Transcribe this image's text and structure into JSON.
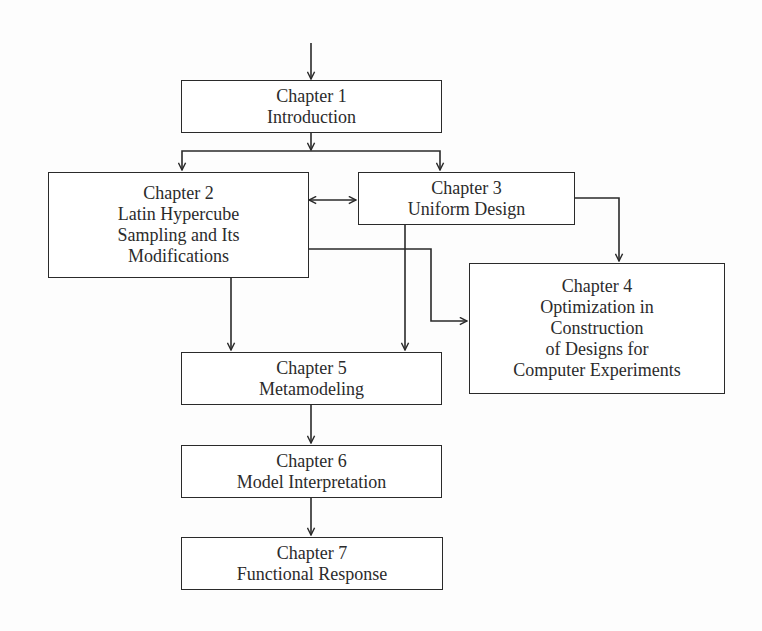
{
  "diagram": {
    "type": "flowchart",
    "colors": {
      "line": "#2a2a2a",
      "text": "#2b2b2b",
      "background": "#fdfdfd"
    },
    "nodes": [
      {
        "id": "ch1",
        "title": "Chapter 1",
        "lines": [
          "Introduction"
        ]
      },
      {
        "id": "ch2",
        "title": "Chapter 2",
        "lines": [
          "Latin Hypercube",
          "Sampling and Its",
          "Modifications"
        ]
      },
      {
        "id": "ch3",
        "title": "Chapter 3",
        "lines": [
          "Uniform Design"
        ]
      },
      {
        "id": "ch4",
        "title": "Chapter 4",
        "lines": [
          "Optimization in",
          "Construction",
          "of Designs for",
          "Computer Experiments"
        ]
      },
      {
        "id": "ch5",
        "title": "Chapter 5",
        "lines": [
          "Metamodeling"
        ]
      },
      {
        "id": "ch6",
        "title": "Chapter 6",
        "lines": [
          "Model Interpretation"
        ]
      },
      {
        "id": "ch7",
        "title": "Chapter 7",
        "lines": [
          "Functional Response"
        ]
      }
    ],
    "edges": [
      {
        "from": "start",
        "to": "ch1",
        "style": "arrow"
      },
      {
        "from": "ch1",
        "to": "ch2",
        "style": "arrow"
      },
      {
        "from": "ch1",
        "to": "ch3",
        "style": "arrow"
      },
      {
        "from": "ch2",
        "to": "ch3",
        "style": "bidirectional"
      },
      {
        "from": "ch2",
        "to": "ch4",
        "style": "arrow"
      },
      {
        "from": "ch3",
        "to": "ch4",
        "style": "arrow"
      },
      {
        "from": "ch2",
        "to": "ch5",
        "style": "arrow"
      },
      {
        "from": "ch3",
        "to": "ch5",
        "style": "arrow"
      },
      {
        "from": "ch5",
        "to": "ch6",
        "style": "arrow"
      },
      {
        "from": "ch6",
        "to": "ch7",
        "style": "arrow"
      }
    ]
  }
}
